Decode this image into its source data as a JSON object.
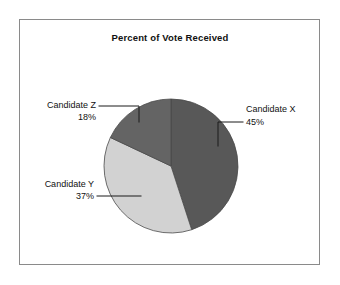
{
  "chart_data": {
    "type": "pie",
    "title": "Percent of Vote Received",
    "categories": [
      "Candidate X",
      "Candidate Y",
      "Candidate Z"
    ],
    "values": [
      45,
      37,
      18
    ],
    "value_suffix": "%",
    "legend": "none",
    "grid": false,
    "slices": [
      {
        "name": "Candidate X",
        "value": 45,
        "value_label": "45%",
        "color": "#585858"
      },
      {
        "name": "Candidate Y",
        "value": 37,
        "value_label": "37%",
        "color": "#d2d2d2"
      },
      {
        "name": "Candidate Z",
        "value": 18,
        "value_label": "18%",
        "color": "#646464"
      }
    ]
  },
  "title": {
    "text": "Percent of Vote Received"
  },
  "labels": {
    "x": {
      "name": "Candidate X",
      "value": "45%"
    },
    "y": {
      "name": "Candidate Y",
      "value": "37%"
    },
    "z": {
      "name": "Candidate Z",
      "value": "18%"
    }
  },
  "colors": {
    "slice_x": "#585858",
    "slice_y": "#d2d2d2",
    "slice_z": "#646464",
    "frame_border": "#8a8a8a",
    "background": "#ffffff",
    "text": "#111111",
    "leader": "#1a1a1a"
  }
}
